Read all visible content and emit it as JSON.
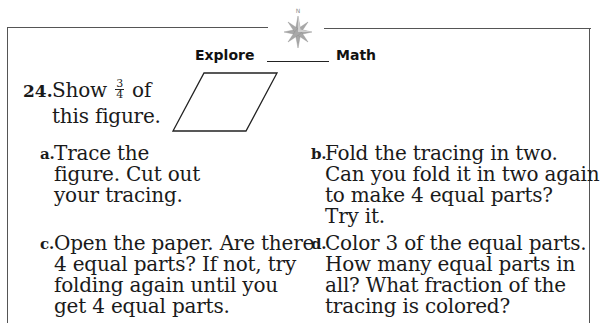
{
  "header": {
    "icon": "compass-rose-icon",
    "compass_letter": "N",
    "title_left": "Explore",
    "title_right": "Math"
  },
  "problem": {
    "number": "24.",
    "text_before_fraction": "Show",
    "fraction": {
      "numerator": "3",
      "denominator": "4"
    },
    "text_after_fraction": "of",
    "text_line2": "this figure.",
    "figure": "parallelogram"
  },
  "steps": [
    {
      "marker": "a.",
      "text": "Trace the\nfigure. Cut out\nyour tracing."
    },
    {
      "marker": "b.",
      "text": "Fold the tracing in two.\nCan you fold it in two again\nto make 4 equal parts?\nTry it."
    },
    {
      "marker": "c.",
      "text": "Open the paper. Are there\n4 equal parts? If not, try\nfolding again until you\nget 4 equal parts."
    },
    {
      "marker": "d.",
      "text": "Color 3 of the equal parts.\nHow many equal parts in\nall? What fraction of the\ntracing is colored?"
    }
  ],
  "colors": {
    "frame": "#555555",
    "compass": "#9a9a9a",
    "text": "#1a1a1a"
  }
}
